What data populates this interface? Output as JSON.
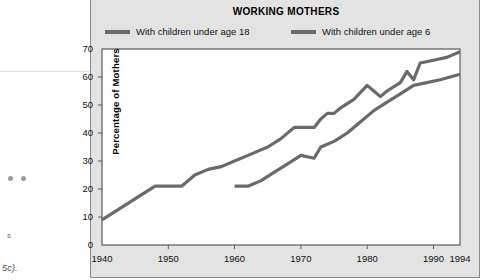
{
  "page_margin": {
    "fragment_letter": "s",
    "fragment_reference": "5c).",
    "dot_1": "bullet-dot",
    "dot_2": "bullet-dot"
  },
  "chart_data": {
    "type": "line",
    "title": "WORKING MOTHERS",
    "xlabel": "",
    "ylabel": "Percentage of Mothers",
    "xlim": [
      1940,
      1994
    ],
    "ylim": [
      0,
      70
    ],
    "grid": false,
    "legend_position": "top",
    "x_ticks": [
      "1940",
      "1950",
      "1960",
      "1970",
      "1980",
      "1990",
      "1994"
    ],
    "x_tick_values": [
      1940,
      1950,
      1960,
      1970,
      1980,
      1990,
      1994
    ],
    "y_ticks": [
      "0",
      "10",
      "20",
      "30",
      "40",
      "50",
      "60",
      "70"
    ],
    "y_tick_values": [
      0,
      10,
      20,
      30,
      40,
      50,
      60,
      70
    ],
    "line_color": "#6a6a6a",
    "series": [
      {
        "name": "With children under age 18",
        "x": [
          1940,
          1948,
          1952,
          1954,
          1956,
          1958,
          1960,
          1963,
          1965,
          1967,
          1969,
          1970,
          1972,
          1973,
          1974,
          1975,
          1976,
          1978,
          1980,
          1981,
          1982,
          1983,
          1985,
          1986,
          1987,
          1988,
          1990,
          1992,
          1994
        ],
        "values": [
          9,
          21,
          21,
          25,
          27,
          28,
          30,
          33,
          35,
          38,
          42,
          42,
          42,
          45,
          47,
          47,
          49,
          52,
          57,
          55,
          53,
          55,
          58,
          62,
          59,
          65,
          66,
          67,
          69
        ]
      },
      {
        "name": "With children under age 6",
        "x": [
          1960,
          1962,
          1964,
          1966,
          1968,
          1970,
          1972,
          1973,
          1975,
          1977,
          1979,
          1981,
          1983,
          1985,
          1987,
          1989,
          1991,
          1994
        ],
        "values": [
          21,
          21,
          23,
          26,
          29,
          32,
          31,
          35,
          37,
          40,
          44,
          48,
          51,
          54,
          57,
          58,
          59,
          61
        ]
      }
    ]
  }
}
